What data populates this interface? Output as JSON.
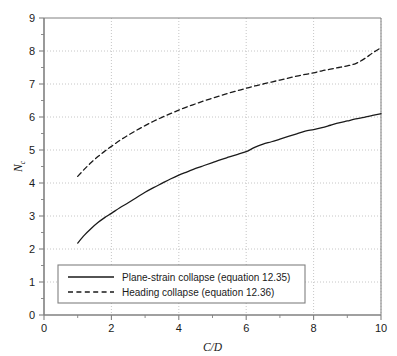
{
  "chart_data": {
    "type": "line",
    "title": "",
    "xlabel": "C/D",
    "ylabel": "Nc",
    "ylabel_base": "N",
    "ylabel_sub": "c",
    "xlim": [
      0,
      10
    ],
    "ylim": [
      0,
      9
    ],
    "grid": true,
    "grid_style": "dotted",
    "legend_position": "bottom-left-inside",
    "xticks": [
      0,
      2,
      4,
      6,
      8,
      10
    ],
    "xtick_labels": [
      "0",
      "2",
      "4",
      "6",
      "8",
      "10"
    ],
    "xminor_ticks": [
      1,
      3,
      5,
      7,
      9
    ],
    "yticks": [
      0,
      1,
      2,
      3,
      4,
      5,
      6,
      7,
      8,
      9
    ],
    "ytick_labels": [
      "0",
      "1",
      "2",
      "3",
      "4",
      "5",
      "6",
      "7",
      "8",
      "9"
    ],
    "yminor_ticks": [
      0.5,
      1.5,
      2.5,
      3.5,
      4.5,
      5.5,
      6.5,
      7.5,
      8.5
    ],
    "x": [
      1.0,
      1.2,
      1.4,
      1.6,
      1.8,
      2.0,
      2.25,
      2.5,
      2.75,
      3.0,
      3.25,
      3.5,
      3.75,
      4.0,
      4.25,
      4.5,
      4.75,
      5.0,
      5.25,
      5.5,
      5.75,
      6.0,
      6.25,
      6.5,
      6.75,
      7.0,
      7.25,
      7.5,
      7.75,
      8.0,
      8.25,
      8.5,
      8.75,
      9.0,
      9.25,
      9.5,
      9.75,
      10.0
    ],
    "series": [
      {
        "name": "Plane-strain collapse (equation 12.35)",
        "style": "solid",
        "color": "#1a1a1a",
        "values": [
          2.18,
          2.42,
          2.62,
          2.8,
          2.95,
          3.08,
          3.25,
          3.4,
          3.56,
          3.72,
          3.86,
          3.99,
          4.12,
          4.24,
          4.34,
          4.44,
          4.53,
          4.62,
          4.71,
          4.79,
          4.87,
          4.95,
          5.08,
          5.18,
          5.25,
          5.33,
          5.41,
          5.49,
          5.57,
          5.62,
          5.68,
          5.75,
          5.82,
          5.88,
          5.94,
          5.99,
          6.05,
          6.1
        ]
      },
      {
        "name": "Heading collapse (equation 12.36)",
        "style": "dashed",
        "color": "#1a1a1a",
        "values": [
          4.2,
          4.42,
          4.62,
          4.8,
          4.96,
          5.11,
          5.29,
          5.45,
          5.6,
          5.74,
          5.87,
          5.99,
          6.1,
          6.21,
          6.31,
          6.4,
          6.49,
          6.57,
          6.65,
          6.73,
          6.8,
          6.87,
          6.94,
          7.0,
          7.06,
          7.12,
          7.18,
          7.24,
          7.29,
          7.34,
          7.4,
          7.45,
          7.5,
          7.55,
          7.62,
          7.76,
          7.94,
          8.1
        ]
      }
    ]
  },
  "legend": {
    "entries": [
      {
        "label": "Plane-strain collapse (equation 12.35)",
        "style": "solid"
      },
      {
        "label": "Heading collapse (equation 12.36)",
        "style": "dashed"
      }
    ]
  },
  "colors": {
    "axis": "#808080",
    "grid": "#b8b8b8",
    "curve": "#1a1a1a",
    "legend_border": "#808080",
    "background": "#ffffff",
    "text": "#1a1a1a"
  }
}
